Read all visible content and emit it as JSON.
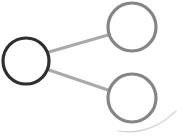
{
  "icon": {
    "name": "share-icon",
    "colors": {
      "primary_node": "#2f2f2f",
      "secondary_node": "#858585",
      "connector": "#a9a9a9",
      "arc": "#d4d4d4",
      "background": "#ffffff"
    },
    "nodes": [
      {
        "id": "source",
        "cx": 26,
        "cy": 61,
        "r": 23
      },
      {
        "id": "target-top",
        "cx": 132,
        "cy": 27,
        "r": 24
      },
      {
        "id": "target-bottom",
        "cx": 132,
        "cy": 98,
        "r": 24
      }
    ],
    "edges": [
      {
        "from": "source",
        "to": "target-top"
      },
      {
        "from": "source",
        "to": "target-bottom"
      }
    ]
  }
}
